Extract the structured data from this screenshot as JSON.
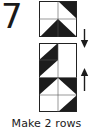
{
  "step": {
    "number": "7"
  },
  "caption": {
    "text": "Make 2 rows"
  },
  "colors": {
    "dark_fabric": "#1c1c1c",
    "light_fabric": "#ffffff",
    "outline": "#222222",
    "text": "#1a1a1a",
    "background": "#ffffff"
  },
  "diagram": {
    "type": "quilt-piecing-instruction",
    "blocks": [
      {
        "name": "top-unit",
        "label": "pinwheel unit",
        "grid_cols": 2,
        "grid_rows": 2,
        "cells": [
          {
            "row": 0,
            "col": 0,
            "pattern": "solid-light"
          },
          {
            "row": 0,
            "col": 1,
            "pattern": "hst-dark-upper-right"
          },
          {
            "row": 1,
            "col": 0,
            "pattern": "hst-dark-lower-right"
          },
          {
            "row": 1,
            "col": 1,
            "pattern": "hst-dark-lower-right"
          }
        ]
      },
      {
        "name": "bottom-unit",
        "label": "row unit",
        "grid_cols": 2,
        "grid_rows": 4,
        "cells": [
          {
            "row": 0,
            "col": 0,
            "pattern": "hst-dark-lower-right"
          },
          {
            "row": 0,
            "col": 1,
            "pattern": "solid-light"
          },
          {
            "row": 1,
            "col": 0,
            "pattern": "hst-dark-upper-left"
          },
          {
            "row": 1,
            "col": 1,
            "pattern": "solid-light"
          },
          {
            "row": 2,
            "col": 0,
            "pattern": "hst-dark-upper-left"
          },
          {
            "row": 2,
            "col": 1,
            "pattern": "hst-dark-upper-right"
          },
          {
            "row": 3,
            "col": 0,
            "pattern": "solid-light"
          },
          {
            "row": 3,
            "col": 1,
            "pattern": "hst-dark-lower-right"
          }
        ]
      }
    ],
    "arrows": [
      {
        "name": "arrow-down",
        "direction": "down"
      },
      {
        "name": "arrow-up",
        "direction": "up"
      }
    ]
  }
}
